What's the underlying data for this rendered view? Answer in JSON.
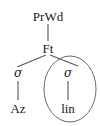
{
  "figure": {
    "type": "prosodic-tree",
    "background_color": "#ffffff",
    "stroke_color": "#555555",
    "text_color": "#1a1a1a",
    "width": 100,
    "height": 126
  },
  "nodes": {
    "root": {
      "label": "PrWd",
      "x": 48,
      "y": 16
    },
    "foot": {
      "label": "Ft",
      "x": 48,
      "y": 48
    },
    "sigma_left": {
      "label": "σ",
      "x": 18,
      "y": 73
    },
    "sigma_right": {
      "label": "σ",
      "x": 68,
      "y": 73
    },
    "leaf_left": {
      "label": "Az",
      "x": 18,
      "y": 108
    },
    "leaf_right": {
      "label": "lin",
      "x": 68,
      "y": 108
    }
  },
  "edges": [
    {
      "name": "prwd-to-ft",
      "from": "PrWd",
      "to": "Ft"
    },
    {
      "name": "ft-to-sigma-left",
      "from": "Ft",
      "to": "σ"
    },
    {
      "name": "ft-to-sigma-right",
      "from": "Ft",
      "to": "σ"
    },
    {
      "name": "sigma-left-to-az",
      "from": "σ",
      "to": "Az"
    },
    {
      "name": "sigma-right-to-lin",
      "from": "σ",
      "to": "lin"
    }
  ],
  "annotation": {
    "circle": {
      "name": "constituent-circle",
      "encloses": [
        "σ",
        "lin"
      ],
      "cx": 70,
      "cy": 89,
      "rx": 26,
      "ry": 33
    }
  }
}
